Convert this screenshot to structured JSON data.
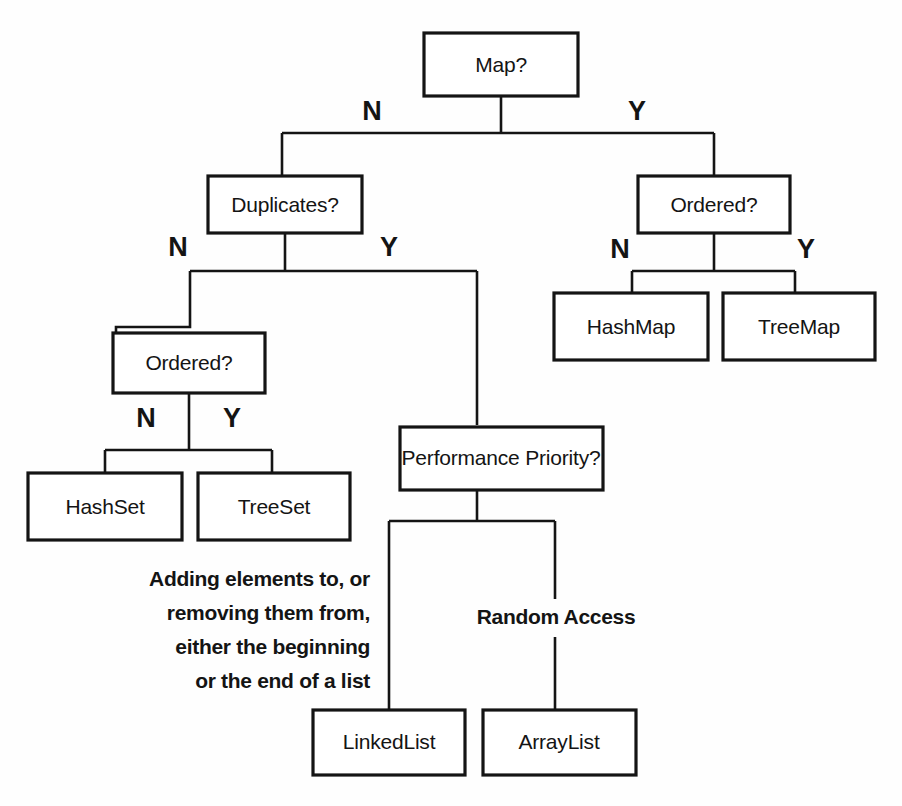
{
  "diagram": {
    "type": "decision-tree",
    "stroke_color": "#141414",
    "fill_color": "#ffffff",
    "background": "#fefefe",
    "nodes": {
      "map_question": "Map?",
      "duplicates_question": "Duplicates?",
      "ordered_question_map": "Ordered?",
      "ordered_question_set": "Ordered?",
      "performance_question": "Performance Priority?",
      "hashmap": "HashMap",
      "treemap": "TreeMap",
      "hashset": "HashSet",
      "treeset": "TreeSet",
      "linkedlist": "LinkedList",
      "arraylist": "ArrayList"
    },
    "branch_labels": {
      "map_no": "N",
      "map_yes": "Y",
      "duplicates_no": "N",
      "duplicates_yes": "Y",
      "ordered_map_no": "N",
      "ordered_map_yes": "Y",
      "ordered_set_no": "N",
      "ordered_set_yes": "Y"
    },
    "edge_descriptions": {
      "linkedlist_line_1": "Adding elements to, or",
      "linkedlist_line_2": "removing them from,",
      "linkedlist_line_3": "either the beginning",
      "linkedlist_line_4": "or the end of a list",
      "arraylist_label": "Random Access"
    }
  }
}
